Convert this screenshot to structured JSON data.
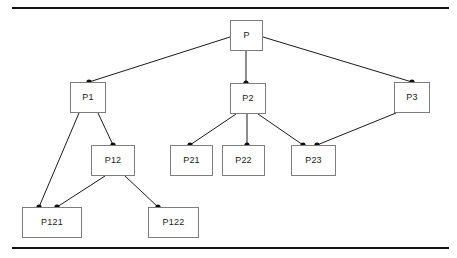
{
  "figure": {
    "background_color": "#ffffff",
    "rule_color": "#141414",
    "box_border_color": "#7d7d7d",
    "edge_color": "#1a1a1a",
    "dot_color": "#0d0d0d"
  },
  "nodes": [
    {
      "id": "P",
      "label": "P",
      "x": 230,
      "y": 20,
      "w": 33,
      "h": 31
    },
    {
      "id": "P1",
      "label": "P1",
      "x": 70,
      "y": 82,
      "w": 36,
      "h": 31
    },
    {
      "id": "P2",
      "label": "P2",
      "x": 230,
      "y": 83,
      "w": 36,
      "h": 31
    },
    {
      "id": "P3",
      "label": "P3",
      "x": 394,
      "y": 82,
      "w": 36,
      "h": 31
    },
    {
      "id": "P12",
      "label": "P12",
      "x": 91,
      "y": 145,
      "w": 44,
      "h": 31
    },
    {
      "id": "P21",
      "label": "P21",
      "x": 170,
      "y": 145,
      "w": 43,
      "h": 31
    },
    {
      "id": "P22",
      "label": "P22",
      "x": 222,
      "y": 145,
      "w": 43,
      "h": 31
    },
    {
      "id": "P23",
      "label": "P23",
      "x": 291,
      "y": 145,
      "w": 45,
      "h": 31
    },
    {
      "id": "P121",
      "label": "P121",
      "x": 22,
      "y": 207,
      "w": 60,
      "h": 31
    },
    {
      "id": "P122",
      "label": "P122",
      "x": 148,
      "y": 207,
      "w": 51,
      "h": 31
    }
  ],
  "edges": [
    {
      "from": "P",
      "to": "P1",
      "x1": 230,
      "y1": 37,
      "x2": 89,
      "y2": 82
    },
    {
      "from": "P",
      "to": "P2",
      "x1": 246,
      "y1": 51,
      "x2": 246,
      "y2": 83
    },
    {
      "from": "P",
      "to": "P3",
      "x1": 263,
      "y1": 37,
      "x2": 412,
      "y2": 82
    },
    {
      "from": "P1",
      "to": "P121",
      "x1": 79,
      "y1": 113,
      "x2": 39,
      "y2": 207
    },
    {
      "from": "P1",
      "to": "P12",
      "x1": 98,
      "y1": 113,
      "x2": 113,
      "y2": 145
    },
    {
      "from": "P2",
      "to": "P21",
      "x1": 236,
      "y1": 114,
      "x2": 190,
      "y2": 145
    },
    {
      "from": "P2",
      "to": "P22",
      "x1": 247,
      "y1": 114,
      "x2": 247,
      "y2": 145
    },
    {
      "from": "P2",
      "to": "P23",
      "x1": 258,
      "y1": 114,
      "x2": 303,
      "y2": 145
    },
    {
      "from": "P3",
      "to": "P23",
      "x1": 396,
      "y1": 113,
      "x2": 317,
      "y2": 145
    },
    {
      "from": "P12",
      "to": "P121",
      "x1": 105,
      "y1": 176,
      "x2": 57,
      "y2": 207
    },
    {
      "from": "P12",
      "to": "P122",
      "x1": 125,
      "y1": 176,
      "x2": 158,
      "y2": 207
    }
  ],
  "dots": [
    {
      "for": "P1-in",
      "x": 89,
      "y": 82
    },
    {
      "for": "P2-in",
      "x": 246,
      "y": 83
    },
    {
      "for": "P3-in",
      "x": 412,
      "y": 82
    },
    {
      "for": "P12-in",
      "x": 113,
      "y": 145
    },
    {
      "for": "P21-in",
      "x": 190,
      "y": 145
    },
    {
      "for": "P22-in",
      "x": 247,
      "y": 145
    },
    {
      "for": "P23-in-a",
      "x": 303,
      "y": 145
    },
    {
      "for": "P23-in-b",
      "x": 317,
      "y": 145
    },
    {
      "for": "P121-in-a",
      "x": 39,
      "y": 207
    },
    {
      "for": "P121-in-b",
      "x": 57,
      "y": 207
    },
    {
      "for": "P122-in",
      "x": 158,
      "y": 207
    }
  ],
  "rules": [
    {
      "id": "rule-top",
      "x": 12,
      "y": 7,
      "w": 437,
      "h": 2
    },
    {
      "id": "rule-bottom",
      "x": 12,
      "y": 247,
      "w": 437,
      "h": 2
    }
  ]
}
